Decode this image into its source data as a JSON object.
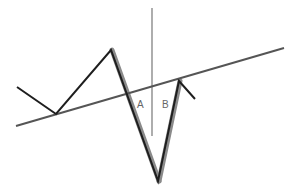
{
  "diagram": {
    "type": "price-pattern-trendline",
    "colors": {
      "background": "#ffffff",
      "price_line": "#1e1e1e",
      "highlight": "#8a8a8a",
      "trendline": "#555555",
      "vertical_line": "#777777",
      "label": "#666666"
    },
    "trendline": {
      "from": [
        16,
        126
      ],
      "to": [
        284,
        48
      ]
    },
    "vertical_line": {
      "x": 152,
      "y1": 8,
      "y2": 136
    },
    "price_path": [
      [
        17,
        87
      ],
      [
        56,
        114
      ],
      [
        111,
        50
      ],
      [
        158,
        181
      ],
      [
        179,
        81
      ],
      [
        195,
        99
      ]
    ],
    "highlight_legs": [
      {
        "from": [
          111,
          50
        ],
        "to": [
          158,
          181
        ]
      },
      {
        "from": [
          158,
          181
        ],
        "to": [
          179,
          81
        ]
      }
    ],
    "labels": [
      {
        "text": "A",
        "x": 137,
        "y": 100
      },
      {
        "text": "B",
        "x": 162,
        "y": 100
      }
    ]
  }
}
